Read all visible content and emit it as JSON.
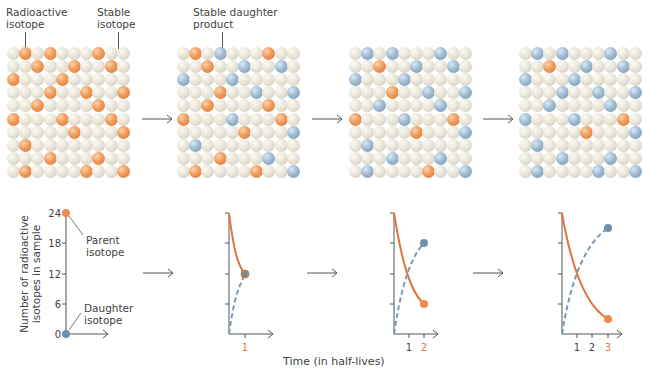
{
  "top_labels": {
    "radioactive_isotope": "Radioactive\nisotope",
    "radioactive_line1": "Radioactive",
    "radioactive_line2": "isotope",
    "stable_line1": "Stable",
    "stable_line2": "isotope",
    "daughter_line1": "Stable daughter",
    "daughter_line2": "product"
  },
  "colors": {
    "radioactive": "#ef9a5a",
    "stable": "#e9e5d8",
    "daughter": "#9fbbd3",
    "parent_curve": "#e0743a",
    "daughter_curve": "#6f93b3"
  },
  "grid_size": {
    "rows": 10,
    "cols": 10
  },
  "grids": [
    {
      "step": 0,
      "orange": [
        [
          0,
          1
        ],
        [
          0,
          3
        ],
        [
          0,
          7
        ],
        [
          1,
          2
        ],
        [
          1,
          5
        ],
        [
          1,
          8
        ],
        [
          2,
          0
        ],
        [
          2,
          4
        ],
        [
          3,
          3
        ],
        [
          3,
          6
        ],
        [
          3,
          9
        ],
        [
          4,
          2
        ],
        [
          4,
          7
        ],
        [
          5,
          0
        ],
        [
          5,
          4
        ],
        [
          5,
          8
        ],
        [
          6,
          5
        ],
        [
          6,
          9
        ],
        [
          7,
          1
        ],
        [
          8,
          3
        ],
        [
          8,
          7
        ],
        [
          9,
          1
        ],
        [
          9,
          6
        ],
        [
          9,
          9
        ]
      ],
      "blue": []
    },
    {
      "step": 1,
      "orange": [
        [
          0,
          1
        ],
        [
          0,
          7
        ],
        [
          1,
          2
        ],
        [
          3,
          3
        ],
        [
          4,
          2
        ],
        [
          4,
          7
        ],
        [
          5,
          0
        ],
        [
          5,
          8
        ],
        [
          6,
          5
        ],
        [
          8,
          3
        ],
        [
          9,
          1
        ],
        [
          9,
          6
        ]
      ],
      "blue": [
        [
          0,
          3
        ],
        [
          1,
          5
        ],
        [
          1,
          8
        ],
        [
          2,
          0
        ],
        [
          2,
          4
        ],
        [
          3,
          6
        ],
        [
          3,
          9
        ],
        [
          5,
          4
        ],
        [
          6,
          9
        ],
        [
          7,
          1
        ],
        [
          8,
          7
        ],
        [
          9,
          9
        ]
      ]
    },
    {
      "step": 2,
      "orange": [
        [
          1,
          2
        ],
        [
          3,
          3
        ],
        [
          5,
          0
        ],
        [
          5,
          8
        ],
        [
          6,
          5
        ],
        [
          9,
          6
        ]
      ],
      "blue": [
        [
          0,
          1
        ],
        [
          0,
          3
        ],
        [
          0,
          7
        ],
        [
          1,
          5
        ],
        [
          1,
          8
        ],
        [
          2,
          0
        ],
        [
          2,
          4
        ],
        [
          3,
          6
        ],
        [
          3,
          9
        ],
        [
          4,
          2
        ],
        [
          4,
          7
        ],
        [
          5,
          4
        ],
        [
          6,
          9
        ],
        [
          7,
          1
        ],
        [
          8,
          3
        ],
        [
          8,
          7
        ],
        [
          9,
          1
        ],
        [
          9,
          9
        ]
      ]
    },
    {
      "step": 3,
      "orange": [
        [
          1,
          2
        ],
        [
          5,
          8
        ],
        [
          6,
          5
        ]
      ],
      "blue": [
        [
          0,
          1
        ],
        [
          0,
          3
        ],
        [
          0,
          7
        ],
        [
          1,
          5
        ],
        [
          1,
          8
        ],
        [
          2,
          0
        ],
        [
          2,
          4
        ],
        [
          3,
          3
        ],
        [
          3,
          6
        ],
        [
          3,
          9
        ],
        [
          4,
          2
        ],
        [
          4,
          7
        ],
        [
          5,
          0
        ],
        [
          5,
          4
        ],
        [
          6,
          9
        ],
        [
          7,
          1
        ],
        [
          8,
          3
        ],
        [
          8,
          7
        ],
        [
          9,
          1
        ],
        [
          9,
          6
        ],
        [
          9,
          9
        ]
      ]
    }
  ],
  "bottom": {
    "ylabel_line1": "Number of radioactive",
    "ylabel_line2": "isotopes in sample",
    "parent_label_line1": "Parent",
    "parent_label_line2": "isotope",
    "daughter_label_line1": "Daughter",
    "daughter_label_line2": "isotope",
    "xlabel": "Time (in half-lives)",
    "yticks": [
      "0",
      "6",
      "12",
      "18",
      "24"
    ],
    "xticks_panel2": [
      "1"
    ],
    "xticks_panel3": [
      "1",
      "2"
    ],
    "xticks_panel4": [
      "1",
      "2",
      "3"
    ]
  },
  "chart_data": {
    "type": "line",
    "title": "",
    "xlabel": "Time (in half-lives)",
    "ylabel": "Number of radioactive isotopes in sample",
    "ylim": [
      0,
      24
    ],
    "yticks": [
      0,
      6,
      12,
      18,
      24
    ],
    "x": [
      0,
      1,
      2,
      3
    ],
    "series": [
      {
        "name": "Parent isotope",
        "style": "solid",
        "color": "#e0743a",
        "values": [
          24,
          12,
          6,
          3
        ]
      },
      {
        "name": "Daughter isotope",
        "style": "dashed",
        "color": "#6f93b3",
        "values": [
          0,
          12,
          18,
          21
        ]
      }
    ],
    "panels": [
      {
        "xmax": 0,
        "parent_end": 24,
        "daughter_end": 0
      },
      {
        "xmax": 1,
        "parent_end": 12,
        "daughter_end": 12
      },
      {
        "xmax": 2,
        "parent_end": 6,
        "daughter_end": 18
      },
      {
        "xmax": 3,
        "parent_end": 3,
        "daughter_end": 21
      }
    ]
  }
}
